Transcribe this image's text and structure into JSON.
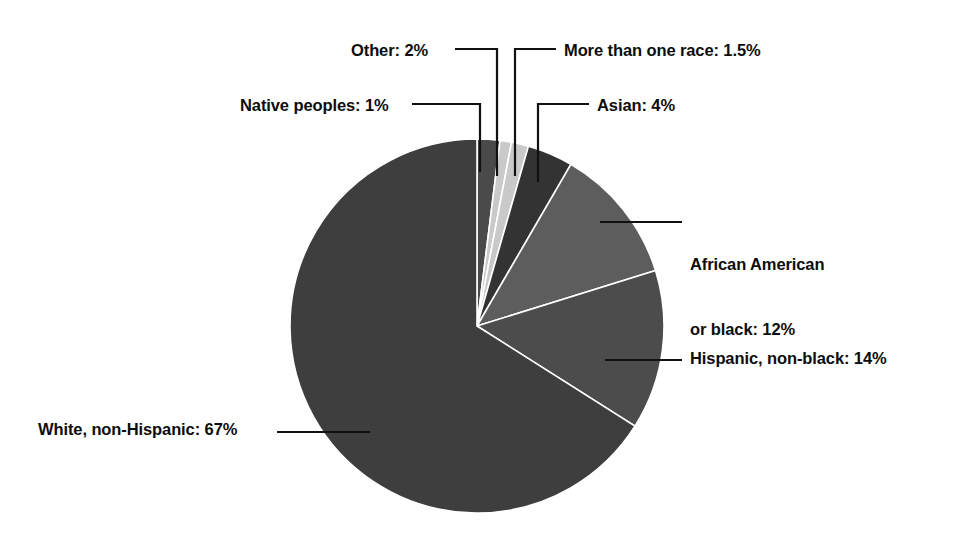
{
  "chart_data": {
    "type": "pie",
    "title": "",
    "xlabel": "",
    "ylabel": "",
    "units": "percent",
    "total": 101.5,
    "start_angle_deg": 0,
    "direction": "clockwise",
    "legend": "none (direct labels with leader lines)",
    "grid": false,
    "categories": [
      "Other",
      "Native peoples",
      "More than one race",
      "Asian",
      "African American or black",
      "Hispanic, non-black",
      "White, non-Hispanic"
    ],
    "values": [
      2,
      1,
      1.5,
      4,
      12,
      14,
      67
    ],
    "slices": [
      {
        "name": "Other",
        "value": 2,
        "label": "Other: 2%",
        "color": "#4a4a4a"
      },
      {
        "name": "Native peoples",
        "value": 1,
        "label": "Native peoples: 1%",
        "color": "#c9c9c9"
      },
      {
        "name": "More than one race",
        "value": 1.5,
        "label": "More than one race: 1.5%",
        "color": "#c9c9c9"
      },
      {
        "name": "Asian",
        "value": 4,
        "label": "Asian: 4%",
        "color": "#333333"
      },
      {
        "name": "African American or black",
        "value": 12,
        "label_line1": "African American",
        "label_line2": "or black: 12%",
        "label": "African American or black: 12%",
        "color": "#5d5d5d"
      },
      {
        "name": "Hispanic, non-black",
        "value": 14,
        "label": "Hispanic, non-black: 14%",
        "color": "#4c4c4c"
      },
      {
        "name": "White, non-Hispanic",
        "value": 67,
        "label": "White, non-Hispanic: 67%",
        "color": "#3e3e3e"
      }
    ]
  },
  "labels": {
    "other": "Other: 2%",
    "native_peoples": "Native peoples: 1%",
    "more_than_one_race": "More than one race: 1.5%",
    "asian": "Asian: 4%",
    "african_american_line1": "African American",
    "african_american_line2": "or black: 12%",
    "hispanic": "Hispanic, non-black: 14%",
    "white": "White, non-Hispanic: 67%"
  },
  "colors": {
    "background": "#ffffff",
    "text": "#0d0d0d",
    "leader_line": "#111111"
  }
}
